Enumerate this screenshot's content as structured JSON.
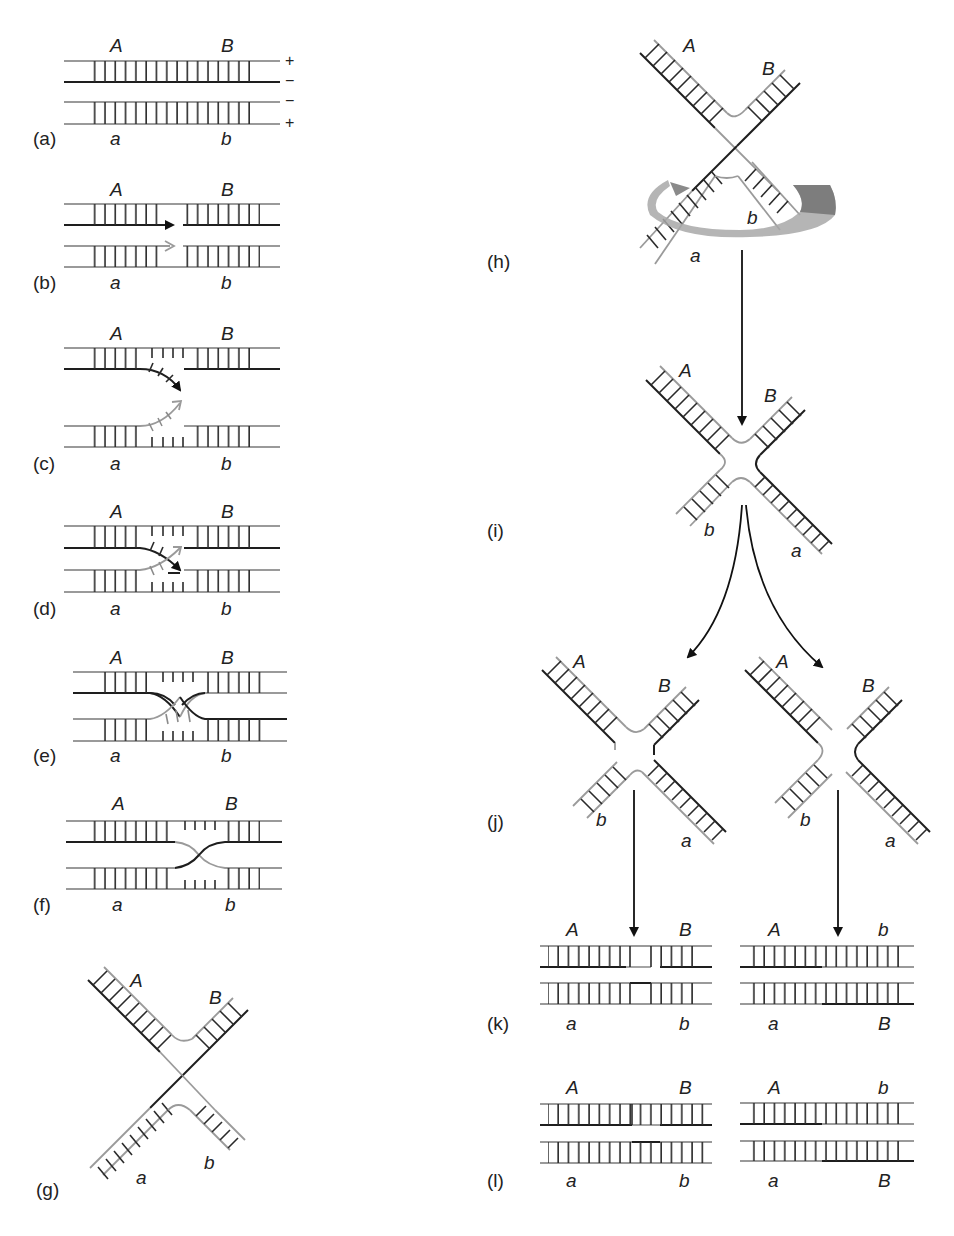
{
  "figure": {
    "panels": [
      {
        "id": "a",
        "label": "(a)",
        "top": [
          "A",
          "B"
        ],
        "bottom": [
          "a",
          "b"
        ],
        "strand_polarity": [
          "+",
          "−",
          "−",
          "+"
        ]
      },
      {
        "id": "b",
        "label": "(b)",
        "top": [
          "A",
          "B"
        ],
        "bottom": [
          "a",
          "b"
        ],
        "note": "nicks in same-polarity strands"
      },
      {
        "id": "c",
        "label": "(c)",
        "top": [
          "A",
          "B"
        ],
        "bottom": [
          "a",
          "b"
        ],
        "note": "strand displacement"
      },
      {
        "id": "d",
        "label": "(d)",
        "top": [
          "A",
          "B"
        ],
        "bottom": [
          "a",
          "b"
        ],
        "note": "strand invasion"
      },
      {
        "id": "e",
        "label": "(e)",
        "top": [
          "A",
          "B"
        ],
        "bottom": [
          "a",
          "b"
        ],
        "note": "ligation, Holliday junction"
      },
      {
        "id": "f",
        "label": "(f)",
        "top": [
          "A",
          "B"
        ],
        "bottom": [
          "a",
          "b"
        ],
        "note": "branch migration"
      },
      {
        "id": "g",
        "label": "(g)",
        "arms": [
          "A",
          "B",
          "a",
          "b"
        ],
        "note": "chi form"
      },
      {
        "id": "h",
        "label": "(h)",
        "arms": [
          "A",
          "B",
          "a",
          "b"
        ],
        "note": "rotation of lower arms"
      },
      {
        "id": "i",
        "label": "(i)",
        "arms": [
          "A",
          "B",
          "b",
          "a"
        ],
        "note": "isomerized open square"
      },
      {
        "id": "j",
        "label": "(j)",
        "left": {
          "arms": [
            "A",
            "B",
            "b",
            "a"
          ],
          "note": "horizontal cut"
        },
        "right": {
          "arms": [
            "A",
            "B",
            "b",
            "a"
          ],
          "note": "vertical cut"
        }
      },
      {
        "id": "k",
        "label": "(k)",
        "left": {
          "top": [
            "A",
            "B"
          ],
          "bottom": [
            "a",
            "b"
          ]
        },
        "right": {
          "top": [
            "A",
            "b"
          ],
          "bottom": [
            "a",
            "B"
          ]
        }
      },
      {
        "id": "l",
        "label": "(l)",
        "left": {
          "top": [
            "A",
            "B"
          ],
          "bottom": [
            "a",
            "b"
          ],
          "note": "patched (non-recombinant)"
        },
        "right": {
          "top": [
            "A",
            "b"
          ],
          "bottom": [
            "a",
            "B"
          ],
          "note": "spliced (recombinant)"
        }
      }
    ],
    "colors": {
      "parental_dark": "#1e1e1e",
      "parental_light": "#9a9a9a",
      "rotation_ribbon": "#a8a8a8"
    }
  },
  "labels": {
    "a": "(a)",
    "b": "(b)",
    "c": "(c)",
    "d": "(d)",
    "e": "(e)",
    "f": "(f)",
    "g": "(g)",
    "h": "(h)",
    "i": "(i)",
    "j": "(j)",
    "k": "(k)",
    "l": "(l)"
  },
  "alleles": {
    "A": "A",
    "B": "B",
    "a": "a",
    "b": "b"
  },
  "polarity": {
    "plus": "+",
    "minus": "−"
  }
}
